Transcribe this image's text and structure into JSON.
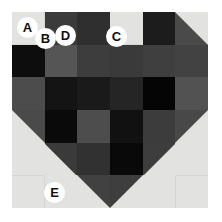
{
  "figure": {
    "name": "heart-pixel-mosaic",
    "background_color": "#ffffff",
    "canvas_color": "#e2e2e0",
    "canvas": {
      "x": 12,
      "y": 12,
      "width": 196,
      "height": 196
    },
    "grid": {
      "columns": 6,
      "rows": 6,
      "cell_size": 32.67
    },
    "grid_line_color": "#d5d5d3"
  },
  "mosaic": {
    "description": "Heart-shaped grayscale pixel mosaic on a light gray square canvas",
    "cells": [
      {
        "row": 1,
        "col": 2,
        "color": "#3b3b3b"
      },
      {
        "row": 1,
        "col": 3,
        "color": "#2f2f2f"
      },
      {
        "row": 1,
        "col": 5,
        "color": "#1c1c1c"
      },
      {
        "row": 1,
        "col": 6,
        "color": "#4a4a4a"
      },
      {
        "row": 2,
        "col": 1,
        "color": "#0d0d0d"
      },
      {
        "row": 2,
        "col": 2,
        "color": "#555555"
      },
      {
        "row": 2,
        "col": 3,
        "color": "#3d3d3d"
      },
      {
        "row": 2,
        "col": 4,
        "color": "#3a3a3a"
      },
      {
        "row": 2,
        "col": 5,
        "color": "#3f3f3f"
      },
      {
        "row": 2,
        "col": 6,
        "color": "#424242"
      },
      {
        "row": 3,
        "col": 1,
        "color": "#4c4c4c"
      },
      {
        "row": 3,
        "col": 2,
        "color": "#141414"
      },
      {
        "row": 3,
        "col": 3,
        "color": "#1a1a1a"
      },
      {
        "row": 3,
        "col": 4,
        "color": "#252525"
      },
      {
        "row": 3,
        "col": 5,
        "color": "#050505"
      },
      {
        "row": 3,
        "col": 6,
        "color": "#525252"
      },
      {
        "row": 4,
        "col": 2,
        "color": "#0a0a0a"
      },
      {
        "row": 4,
        "col": 3,
        "color": "#4d4d4d"
      },
      {
        "row": 4,
        "col": 4,
        "color": "#111111"
      },
      {
        "row": 4,
        "col": 5,
        "color": "#3c3c3c"
      },
      {
        "row": 5,
        "col": 3,
        "color": "#313131"
      },
      {
        "row": 5,
        "col": 4,
        "color": "#090909"
      },
      {
        "row": 6,
        "col": 0,
        "color": "none"
      }
    ],
    "silhouette_triangles": [
      {
        "name": "top-left-lobe-corner",
        "color": "#e2e2e0"
      },
      {
        "name": "top-center-notch",
        "color": "#e2e2e0"
      },
      {
        "name": "top-right-lobe-corner",
        "color": "#e2e2e0"
      },
      {
        "name": "left-taper",
        "color": "#e2e2e0"
      },
      {
        "name": "right-taper",
        "color": "#e2e2e0"
      },
      {
        "name": "bottom-point",
        "color": "#e2e2e0"
      }
    ]
  },
  "labels": [
    {
      "id": "A",
      "text": "A",
      "x": 17,
      "y": 17
    },
    {
      "id": "B",
      "text": "B",
      "x": 35,
      "y": 28
    },
    {
      "id": "C",
      "text": "C",
      "x": 106,
      "y": 26
    },
    {
      "id": "D",
      "text": "D",
      "x": 55,
      "y": 25
    },
    {
      "id": "E",
      "text": "E",
      "x": 44,
      "y": 182
    }
  ],
  "legend": {
    "badge_fill": "#ffffff",
    "badge_text_color": "#111111"
  }
}
